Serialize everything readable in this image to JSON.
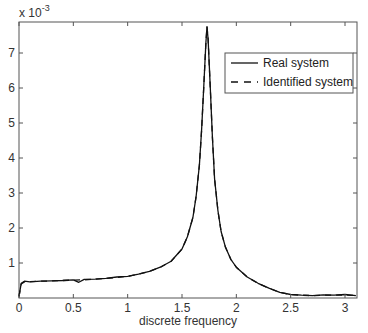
{
  "chart_data": {
    "type": "line",
    "title": "",
    "xlabel": "discrete frequency",
    "ylabel": "",
    "y_exponent_label": "x 10",
    "y_exponent_power": "-3",
    "xlim": [
      0,
      3.1
    ],
    "ylim": [
      0,
      7.9
    ],
    "y_scale": 0.001,
    "grid": false,
    "legend_position": "upper right",
    "x_ticks": [
      0,
      0.5,
      1,
      1.5,
      2,
      2.5,
      3
    ],
    "x_tick_labels": [
      "0",
      "0.5",
      "1",
      "1.5",
      "2",
      "2.5",
      "3"
    ],
    "y_ticks": [
      1,
      2,
      3,
      4,
      5,
      6,
      7
    ],
    "y_tick_labels": [
      "1",
      "2",
      "3",
      "4",
      "5",
      "6",
      "7"
    ],
    "legend": [
      "Real system",
      "Identified system"
    ],
    "series": [
      {
        "name": "Real system",
        "style": "solid",
        "color": "#111111",
        "x": [
          0.0,
          0.02,
          0.05,
          0.1,
          0.2,
          0.3,
          0.4,
          0.5,
          0.55,
          0.6,
          0.7,
          0.8,
          0.9,
          1.0,
          1.1,
          1.2,
          1.3,
          1.4,
          1.5,
          1.55,
          1.6,
          1.63,
          1.66,
          1.68,
          1.7,
          1.72,
          1.73,
          1.74,
          1.76,
          1.78,
          1.8,
          1.83,
          1.86,
          1.9,
          1.95,
          2.0,
          2.1,
          2.2,
          2.3,
          2.4,
          2.5,
          2.6,
          2.7,
          2.8,
          2.9,
          3.0,
          3.1
        ],
        "values": [
          0.05,
          0.42,
          0.48,
          0.46,
          0.48,
          0.49,
          0.5,
          0.52,
          0.45,
          0.53,
          0.54,
          0.56,
          0.6,
          0.62,
          0.68,
          0.76,
          0.88,
          1.05,
          1.4,
          1.75,
          2.3,
          2.9,
          3.8,
          4.8,
          6.0,
          7.3,
          7.75,
          7.4,
          6.0,
          4.6,
          3.4,
          2.5,
          1.9,
          1.45,
          1.1,
          0.88,
          0.6,
          0.42,
          0.28,
          0.16,
          0.1,
          0.08,
          0.07,
          0.09,
          0.08,
          0.1,
          0.07
        ]
      },
      {
        "name": "Identified system",
        "style": "dashed",
        "color": "#111111",
        "x": [
          0.0,
          0.02,
          0.05,
          0.1,
          0.2,
          0.3,
          0.4,
          0.5,
          0.6,
          0.7,
          0.8,
          0.9,
          1.0,
          1.1,
          1.2,
          1.3,
          1.4,
          1.5,
          1.55,
          1.6,
          1.63,
          1.66,
          1.68,
          1.7,
          1.72,
          1.73,
          1.74,
          1.76,
          1.78,
          1.8,
          1.83,
          1.86,
          1.9,
          1.95,
          2.0,
          2.1,
          2.2,
          2.3,
          2.4,
          2.5,
          2.6,
          2.7,
          2.8,
          2.9,
          3.0,
          3.1
        ],
        "values": [
          0.05,
          0.4,
          0.46,
          0.47,
          0.48,
          0.49,
          0.5,
          0.51,
          0.52,
          0.54,
          0.56,
          0.59,
          0.62,
          0.68,
          0.76,
          0.88,
          1.05,
          1.4,
          1.75,
          2.3,
          2.9,
          3.8,
          4.8,
          6.0,
          7.3,
          7.75,
          7.4,
          6.0,
          4.6,
          3.4,
          2.5,
          1.9,
          1.45,
          1.1,
          0.88,
          0.6,
          0.42,
          0.28,
          0.16,
          0.1,
          0.08,
          0.07,
          0.08,
          0.08,
          0.09,
          0.07
        ]
      }
    ]
  },
  "layout": {
    "plot_left": 19,
    "plot_right": 357,
    "plot_top": 22,
    "plot_bottom": 298,
    "x_px_per_unit": 108.67,
    "y_px_per_unit": 35
  },
  "colors": {
    "axis": "#555555",
    "line": "#111111",
    "background": "#ffffff"
  }
}
